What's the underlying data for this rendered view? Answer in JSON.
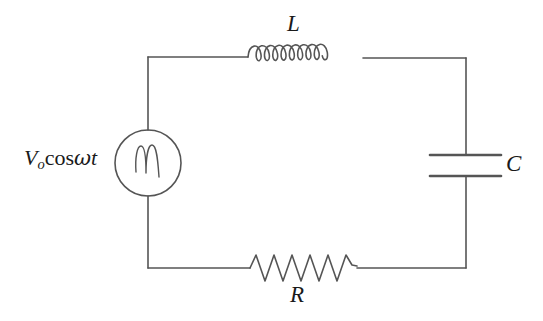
{
  "figure": {
    "kind": "circuit-diagram",
    "background_color": "#ffffff",
    "line_color": "#555555",
    "text_color": "#1a1a1a",
    "stroke_width": 1.6
  },
  "labels": {
    "inductor": "L",
    "capacitor": "C",
    "resistor": "R",
    "source_V": "V",
    "source_sub": "o",
    "source_cos": "cos",
    "source_omega": "ω",
    "source_t": "t"
  },
  "components": {
    "source": {
      "name": "ac-voltage-source",
      "symbol": "circle-with-wave",
      "center_x": 148,
      "center_y": 163,
      "radius": 33
    },
    "inductor": {
      "name": "inductor",
      "symbol": "coil",
      "coil_count": 9,
      "start_x": 248,
      "end_x": 364,
      "baseline_y": 57,
      "loop_height": 15
    },
    "capacitor": {
      "name": "capacitor",
      "symbol": "parallel-plates",
      "plate_left_x": 430,
      "plate_right_x": 501,
      "top_plate_y": 155,
      "bottom_plate_y": 176
    },
    "resistor": {
      "name": "resistor",
      "symbol": "zigzag",
      "peak_count": 6,
      "start_x": 250,
      "end_x": 356,
      "baseline_y": 268,
      "amplitude": 15
    }
  },
  "loop": {
    "left_x": 148,
    "right_x": 466,
    "top_y": 57,
    "bottom_y": 268
  }
}
